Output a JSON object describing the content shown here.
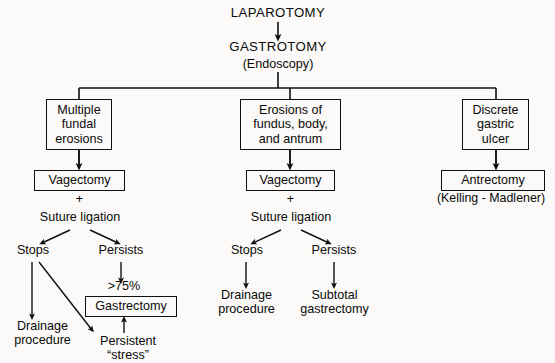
{
  "diagram": {
    "title": "LAPAROTOMY",
    "root": {
      "step1": "LAPAROTOMY",
      "step2": "GASTROTOMY",
      "step2_note": "(Endoscopy)"
    },
    "branches": [
      {
        "id": "left",
        "finding": "Multiple\nfundal\nerosions",
        "procedure": "Vagectomy",
        "plus": "+",
        "adjunct": "Suture ligation",
        "outcomes": [
          {
            "label": "Stops",
            "result": "Drainage\nprocedure"
          },
          {
            "label": "Persists",
            "qualifier": ">75%",
            "result": "Gastrectomy",
            "secondary": "Persistent\n“stress”"
          }
        ]
      },
      {
        "id": "center",
        "finding": "Erosions of\nfundus, body,\nand antrum",
        "procedure": "Vagectomy",
        "plus": "+",
        "adjunct": "Suture ligation",
        "outcomes": [
          {
            "label": "Stops",
            "result": "Drainage\nprocedure"
          },
          {
            "label": "Persists",
            "result": "Subtotal\ngastrectomy"
          }
        ]
      },
      {
        "id": "right",
        "finding": "Discrete\ngastric\nulcer",
        "procedure": "Antrectomy",
        "procedure_note": "(Kelling - Madlener)"
      }
    ],
    "colors": {
      "ink": "#0a0a0a",
      "line": "#101010",
      "background": "#fbfaf8"
    }
  }
}
